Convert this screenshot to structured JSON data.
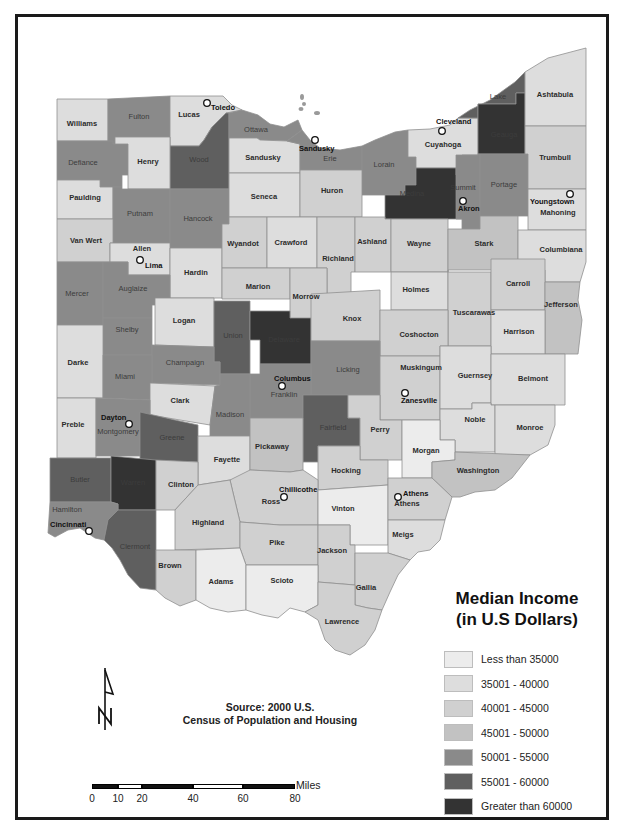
{
  "map": {
    "title": "Median Income (in U.S Dollars)",
    "state": "Ohio",
    "source_line1": "Source: 2000 U.S.",
    "source_line2": "Census of Population and Housing"
  },
  "legend": {
    "title_line1": "Median Income",
    "title_line2": "(in U.S Dollars)",
    "classes": [
      {
        "label": "Less than 35000",
        "color": "#ececec"
      },
      {
        "label": "35001 - 40000",
        "color": "#dddddd"
      },
      {
        "label": "40001 - 45000",
        "color": "#d0d0d0"
      },
      {
        "label": "45001 - 50000",
        "color": "#c2c2c2"
      },
      {
        "label": "50001 - 55000",
        "color": "#8a8a8a"
      },
      {
        "label": "55001 - 60000",
        "color": "#5f5f5f"
      },
      {
        "label": "Greater than 60000",
        "color": "#333333"
      }
    ]
  },
  "scale": {
    "unit": "Miles",
    "ticks": [
      "0",
      "10",
      "20",
      "40",
      "60",
      "80"
    ]
  },
  "north_arrow": {
    "label": "N"
  },
  "cities": [
    {
      "name": "Toledo",
      "x": 207,
      "y": 103,
      "lx": 211,
      "ly": 110
    },
    {
      "name": "Sandusky",
      "x": 315,
      "y": 140,
      "lx": 299,
      "ly": 151
    },
    {
      "name": "Cleveland",
      "x": 442,
      "y": 131,
      "lx": 436,
      "ly": 124
    },
    {
      "name": "Akron",
      "x": 463,
      "y": 201,
      "lx": 458,
      "ly": 211
    },
    {
      "name": "Youngstown",
      "x": 570,
      "y": 194,
      "lx": 530,
      "ly": 204
    },
    {
      "name": "Lima",
      "x": 140,
      "y": 260,
      "lx": 145,
      "ly": 268
    },
    {
      "name": "Columbus",
      "x": 282,
      "y": 386,
      "lx": 274,
      "ly": 381
    },
    {
      "name": "Zanesville",
      "x": 405,
      "y": 393,
      "lx": 401,
      "ly": 403
    },
    {
      "name": "Dayton",
      "x": 129,
      "y": 424,
      "lx": 101,
      "ly": 420
    },
    {
      "name": "Chillicothe",
      "x": 284,
      "y": 497,
      "lx": 279,
      "ly": 492
    },
    {
      "name": "Athens",
      "x": 398,
      "y": 497,
      "lx": 403,
      "ly": 496
    },
    {
      "name": "Cincinnati",
      "x": 89,
      "y": 531,
      "lx": 50,
      "ly": 527
    }
  ],
  "counties": [
    {
      "name": "Williams",
      "cls": 1,
      "lx": 82,
      "ly": 126
    },
    {
      "name": "Fulton",
      "cls": 4,
      "lx": 139,
      "ly": 119
    },
    {
      "name": "Lucas",
      "cls": 1,
      "lx": 189,
      "ly": 117
    },
    {
      "name": "Wood",
      "cls": 5,
      "lx": 199,
      "ly": 162
    },
    {
      "name": "Ottawa",
      "cls": 4,
      "lx": 256,
      "ly": 132
    },
    {
      "name": "Sandusky",
      "cls": 1,
      "lx": 263,
      "ly": 160
    },
    {
      "name": "Erie",
      "cls": 4,
      "lx": 330,
      "ly": 161
    },
    {
      "name": "Lorain",
      "cls": 4,
      "lx": 384,
      "ly": 167
    },
    {
      "name": "Cuyahoga",
      "cls": 1,
      "lx": 443,
      "ly": 147
    },
    {
      "name": "Lake",
      "cls": 5,
      "lx": 498,
      "ly": 99
    },
    {
      "name": "Geauga",
      "cls": 6,
      "lx": 504,
      "ly": 137
    },
    {
      "name": "Ashtabula",
      "cls": 1,
      "lx": 555,
      "ly": 97
    },
    {
      "name": "Defiance",
      "cls": 4,
      "lx": 83,
      "ly": 165
    },
    {
      "name": "Henry",
      "cls": 1,
      "lx": 148,
      "ly": 164
    },
    {
      "name": "Paulding",
      "cls": 1,
      "lx": 85,
      "ly": 200
    },
    {
      "name": "Putnam",
      "cls": 4,
      "lx": 140,
      "ly": 216
    },
    {
      "name": "Hancock",
      "cls": 4,
      "lx": 198,
      "ly": 221
    },
    {
      "name": "Seneca",
      "cls": 1,
      "lx": 264,
      "ly": 199
    },
    {
      "name": "Huron",
      "cls": 2,
      "lx": 332,
      "ly": 193
    },
    {
      "name": "Medina",
      "cls": 6,
      "lx": 412,
      "ly": 196
    },
    {
      "name": "Summit",
      "cls": 4,
      "lx": 463,
      "ly": 190
    },
    {
      "name": "Portage",
      "cls": 4,
      "lx": 504,
      "ly": 187
    },
    {
      "name": "Trumbull",
      "cls": 2,
      "lx": 555,
      "ly": 160
    },
    {
      "name": "Mahoning",
      "cls": 1,
      "lx": 558,
      "ly": 215
    },
    {
      "name": "Van Wert",
      "cls": 2,
      "lx": 86,
      "ly": 243
    },
    {
      "name": "Allen",
      "cls": 1,
      "lx": 142,
      "ly": 251
    },
    {
      "name": "Hardin",
      "cls": 1,
      "lx": 196,
      "ly": 275
    },
    {
      "name": "Wyandot",
      "cls": 2,
      "lx": 243,
      "ly": 246
    },
    {
      "name": "Crawford",
      "cls": 1,
      "lx": 291,
      "ly": 245
    },
    {
      "name": "Richland",
      "cls": 2,
      "lx": 338,
      "ly": 261
    },
    {
      "name": "Ashland",
      "cls": 2,
      "lx": 372,
      "ly": 244
    },
    {
      "name": "Wayne",
      "cls": 2,
      "lx": 419,
      "ly": 246
    },
    {
      "name": "Stark",
      "cls": 3,
      "lx": 484,
      "ly": 246
    },
    {
      "name": "Columbiana",
      "cls": 1,
      "lx": 561,
      "ly": 252
    },
    {
      "name": "Mercer",
      "cls": 4,
      "lx": 77,
      "ly": 296
    },
    {
      "name": "Auglaize",
      "cls": 4,
      "lx": 133,
      "ly": 291
    },
    {
      "name": "Marion",
      "cls": 2,
      "lx": 258,
      "ly": 289
    },
    {
      "name": "Morrow",
      "cls": 2,
      "lx": 306,
      "ly": 299
    },
    {
      "name": "Holmes",
      "cls": 1,
      "lx": 416,
      "ly": 292
    },
    {
      "name": "Tuscarawas",
      "cls": 2,
      "lx": 474,
      "ly": 315
    },
    {
      "name": "Carroll",
      "cls": 2,
      "lx": 518,
      "ly": 286
    },
    {
      "name": "Jefferson",
      "cls": 3,
      "lx": 561,
      "ly": 307
    },
    {
      "name": "Logan",
      "cls": 1,
      "lx": 184,
      "ly": 323
    },
    {
      "name": "Union",
      "cls": 5,
      "lx": 233,
      "ly": 338
    },
    {
      "name": "Delaware",
      "cls": 6,
      "lx": 284,
      "ly": 342
    },
    {
      "name": "Knox",
      "cls": 2,
      "lx": 352,
      "ly": 321
    },
    {
      "name": "Coshocton",
      "cls": 2,
      "lx": 419,
      "ly": 337
    },
    {
      "name": "Harrison",
      "cls": 1,
      "lx": 519,
      "ly": 334
    },
    {
      "name": "Shelby",
      "cls": 4,
      "lx": 127,
      "ly": 332
    },
    {
      "name": "Darke",
      "cls": 1,
      "lx": 78,
      "ly": 365
    },
    {
      "name": "Champaign",
      "cls": 4,
      "lx": 185,
      "ly": 365
    },
    {
      "name": "Miami",
      "cls": 4,
      "lx": 125,
      "ly": 379
    },
    {
      "name": "Licking",
      "cls": 4,
      "lx": 348,
      "ly": 372
    },
    {
      "name": "Muskingum",
      "cls": 2,
      "lx": 421,
      "ly": 370
    },
    {
      "name": "Guernsey",
      "cls": 1,
      "lx": 475,
      "ly": 378
    },
    {
      "name": "Belmont",
      "cls": 1,
      "lx": 533,
      "ly": 381
    },
    {
      "name": "Clark",
      "cls": 1,
      "lx": 180,
      "ly": 403
    },
    {
      "name": "Franklin",
      "cls": 4,
      "lx": 284,
      "ly": 397
    },
    {
      "name": "Madison",
      "cls": 4,
      "lx": 230,
      "ly": 417
    },
    {
      "name": "Preble",
      "cls": 1,
      "lx": 73,
      "ly": 427
    },
    {
      "name": "Montgomery",
      "cls": 4,
      "lx": 118,
      "ly": 434
    },
    {
      "name": "Greene",
      "cls": 5,
      "lx": 172,
      "ly": 440
    },
    {
      "name": "Fairfield",
      "cls": 5,
      "lx": 333,
      "ly": 430
    },
    {
      "name": "Perry",
      "cls": 2,
      "lx": 380,
      "ly": 432
    },
    {
      "name": "Noble",
      "cls": 1,
      "lx": 475,
      "ly": 422
    },
    {
      "name": "Monroe",
      "cls": 1,
      "lx": 530,
      "ly": 430
    },
    {
      "name": "Fayette",
      "cls": 1,
      "lx": 227,
      "ly": 462
    },
    {
      "name": "Pickaway",
      "cls": 3,
      "lx": 272,
      "ly": 449
    },
    {
      "name": "Hocking",
      "cls": 2,
      "lx": 346,
      "ly": 473
    },
    {
      "name": "Morgan",
      "cls": 0,
      "lx": 426,
      "ly": 453
    },
    {
      "name": "Washington",
      "cls": 3,
      "lx": 478,
      "ly": 473
    },
    {
      "name": "Butler",
      "cls": 5,
      "lx": 80,
      "ly": 482
    },
    {
      "name": "Warren",
      "cls": 6,
      "lx": 133,
      "ly": 485
    },
    {
      "name": "Clinton",
      "cls": 2,
      "lx": 181,
      "ly": 487
    },
    {
      "name": "Ross",
      "cls": 2,
      "lx": 271,
      "ly": 504
    },
    {
      "name": "Vinton",
      "cls": 0,
      "lx": 343,
      "ly": 511
    },
    {
      "name": "Athens",
      "cls": 2,
      "lx": 407,
      "ly": 506
    },
    {
      "name": "Hamilton",
      "cls": 4,
      "lx": 67,
      "ly": 512
    },
    {
      "name": "Highland",
      "cls": 2,
      "lx": 208,
      "ly": 525
    },
    {
      "name": "Clermont",
      "cls": 5,
      "lx": 135,
      "ly": 549
    },
    {
      "name": "Pike",
      "cls": 2,
      "lx": 277,
      "ly": 545
    },
    {
      "name": "Jackson",
      "cls": 2,
      "lx": 332,
      "ly": 553
    },
    {
      "name": "Meigs",
      "cls": 1,
      "lx": 403,
      "ly": 537
    },
    {
      "name": "Brown",
      "cls": 2,
      "lx": 170,
      "ly": 568
    },
    {
      "name": "Adams",
      "cls": 0,
      "lx": 221,
      "ly": 584
    },
    {
      "name": "Scioto",
      "cls": 0,
      "lx": 282,
      "ly": 583
    },
    {
      "name": "Gallia",
      "cls": 2,
      "lx": 366,
      "ly": 590
    },
    {
      "name": "Lawrence",
      "cls": 2,
      "lx": 342,
      "ly": 624
    }
  ]
}
